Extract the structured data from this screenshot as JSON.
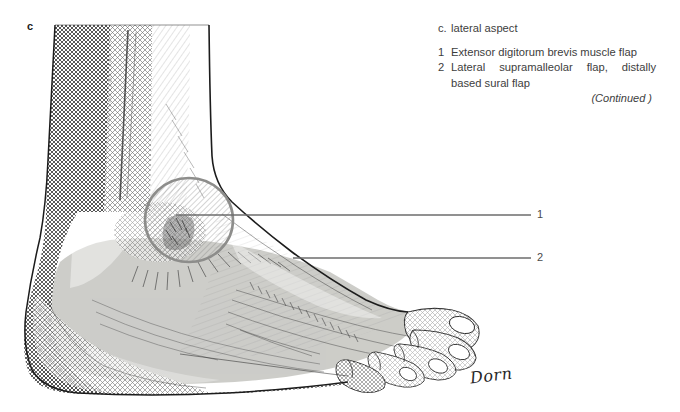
{
  "figure": {
    "panel_label": "c",
    "illustration_subject": "foot-ankle-lateral-view-line-drawing",
    "signature": "Dorn"
  },
  "caption": {
    "heading_marker": "c.",
    "heading_text": "lateral aspect",
    "items": [
      {
        "number": "1",
        "text": "Extensor digitorum brevis muscle flap"
      },
      {
        "number": "2",
        "text": "Lateral supramalleolar flap, distally based sural flap"
      }
    ],
    "continued_note": "(Continued )"
  },
  "leaders": [
    {
      "label": "1",
      "target": "extensor-digitorum-brevis-circle"
    },
    {
      "label": "2",
      "target": "lateral-supramalleolar-flap-area"
    }
  ],
  "colors": {
    "background": "#ffffff",
    "ink": "#1f1f1f",
    "ink_soft": "#3d3d3d",
    "leader_line": "#6d6d6d",
    "flap_overlay": "#c9c9c4",
    "circle_outline": "#8a8a88",
    "hatch": "#555555"
  }
}
